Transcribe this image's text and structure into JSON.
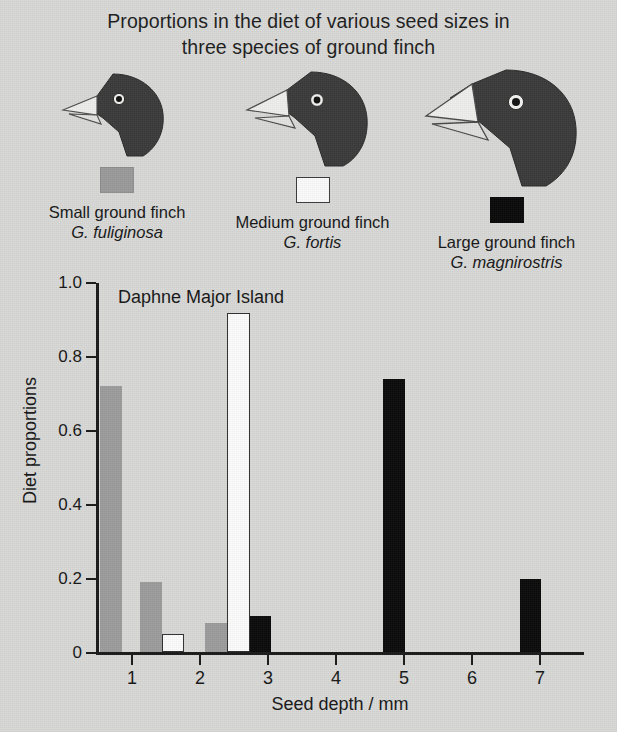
{
  "caption": {
    "line1": "Proportions in the diet of various seed sizes in",
    "line2": "three species of ground finch"
  },
  "legend": {
    "items": [
      {
        "common_name": "Small ground finch",
        "latin_name": "G. fuliginosa",
        "swatch": "gray",
        "color": "#9c9c9c",
        "bird_icon": "finch-head-small-icon"
      },
      {
        "common_name": "Medium ground finch",
        "latin_name": "G. fortis",
        "swatch": "white",
        "color": "#fcfcfc",
        "bird_icon": "finch-head-medium-icon"
      },
      {
        "common_name": "Large ground finch",
        "latin_name": "G. magnirostris",
        "swatch": "black",
        "color": "#0a0a0a",
        "bird_icon": "finch-head-large-icon"
      }
    ]
  },
  "chart_data": {
    "type": "bar",
    "title": "Proportions in the diet of various seed sizes in three species of ground finch",
    "panel_label": "Daphne Major Island",
    "xlabel": "Seed depth / mm",
    "ylabel": "Diet proportions",
    "xlim": [
      0.5,
      7.6
    ],
    "ylim": [
      0,
      1.0
    ],
    "grid": false,
    "legend_position": "above-plot",
    "xticks": [
      1,
      2,
      3,
      4,
      5,
      6,
      7
    ],
    "xtick_labels": [
      "1",
      "2",
      "3",
      "4",
      "5",
      "6",
      "7"
    ],
    "yticks": [
      0,
      0.2,
      0.4,
      0.6,
      0.8,
      1.0
    ],
    "ytick_labels": [
      "0",
      "0.2",
      "0.4",
      "0.6",
      "0.8",
      "1.0"
    ],
    "series": [
      {
        "name": "Small ground finch (G. fuliginosa)",
        "color": "#9c9c9c",
        "style": "gray",
        "bars": [
          {
            "x_start": 0.53,
            "x_end": 0.85,
            "value": 0.72
          },
          {
            "x_start": 1.12,
            "x_end": 1.44,
            "value": 0.19
          },
          {
            "x_start": 2.08,
            "x_end": 2.4,
            "value": 0.08
          }
        ]
      },
      {
        "name": "Medium ground finch (G. fortis)",
        "color": "#fcfcfc",
        "style": "white",
        "bars": [
          {
            "x_start": 1.44,
            "x_end": 1.76,
            "value": 0.05
          },
          {
            "x_start": 2.4,
            "x_end": 2.73,
            "value": 0.92
          }
        ]
      },
      {
        "name": "Large ground finch (G. magnirostris)",
        "color": "#0a0a0a",
        "style": "black",
        "bars": [
          {
            "x_start": 2.73,
            "x_end": 3.05,
            "value": 0.1
          },
          {
            "x_start": 4.69,
            "x_end": 5.01,
            "value": 0.74
          },
          {
            "x_start": 6.7,
            "x_end": 7.02,
            "value": 0.2
          }
        ]
      }
    ]
  }
}
